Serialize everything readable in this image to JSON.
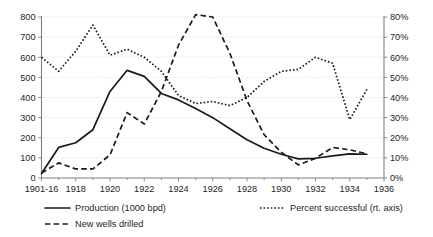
{
  "chart_data": {
    "type": "line",
    "title": "",
    "subtitle": "",
    "xlabel": "",
    "ylabel": "",
    "y2label": "",
    "grid": true,
    "legend_position": "bottom",
    "xlim": [
      1916,
      1936
    ],
    "ylim": [
      0,
      800
    ],
    "y2lim": [
      0,
      0.8
    ],
    "x_tick_labels": [
      "1901-16",
      "1918",
      "1920",
      "1922",
      "1924",
      "1926",
      "1928",
      "1930",
      "1932",
      "1934",
      "1936"
    ],
    "x_tick_values": [
      1916,
      1918,
      1920,
      1922,
      1924,
      1926,
      1928,
      1930,
      1932,
      1934,
      1936
    ],
    "x_minor_step": 1,
    "y_tick_labels": [
      "0",
      "100",
      "200",
      "300",
      "400",
      "500",
      "600",
      "700",
      "800"
    ],
    "y_tick_values": [
      0,
      100,
      200,
      300,
      400,
      500,
      600,
      700,
      800
    ],
    "y2_tick_labels": [
      "0%",
      "10%",
      "20%",
      "30%",
      "40%",
      "50%",
      "60%",
      "70%",
      "80%"
    ],
    "y2_tick_values": [
      0,
      10,
      20,
      30,
      40,
      50,
      60,
      70,
      80
    ],
    "x": [
      1916,
      1917,
      1918,
      1919,
      1920,
      1921,
      1922,
      1923,
      1924,
      1925,
      1926,
      1927,
      1928,
      1929,
      1930,
      1931,
      1932,
      1933,
      1934,
      1935
    ],
    "series": [
      {
        "name": "Production (1000 bpd)",
        "axis": "left",
        "style": "solid",
        "values": [
          22,
          152,
          175,
          240,
          430,
          535,
          505,
          420,
          388,
          345,
          300,
          245,
          190,
          148,
          118,
          95,
          98,
          110,
          120,
          118
        ]
      },
      {
        "name": "New wells drilled",
        "axis": "left",
        "style": "dashed",
        "values": [
          25,
          75,
          45,
          45,
          115,
          325,
          268,
          430,
          660,
          812,
          800,
          620,
          385,
          215,
          128,
          65,
          98,
          152,
          140,
          120
        ]
      },
      {
        "name": "Percent successful (rt. axis)",
        "axis": "right",
        "style": "dotted",
        "values": [
          60,
          53,
          63,
          76,
          61,
          64,
          60,
          53,
          41,
          37,
          38,
          36,
          40,
          48,
          53,
          54,
          60,
          57,
          29,
          44
        ]
      }
    ],
    "legend": [
      {
        "label": "Production (1000 bpd)",
        "style": "solid"
      },
      {
        "label": "Percent successful (rt. axis)",
        "style": "dotted"
      },
      {
        "label": "New wells drilled",
        "style": "dashed"
      }
    ],
    "colors": {
      "series": "#1a1a1a",
      "grid": "#c9c9c9",
      "axis": "#808080",
      "background": "#ffffff",
      "text": "#231f20"
    }
  }
}
